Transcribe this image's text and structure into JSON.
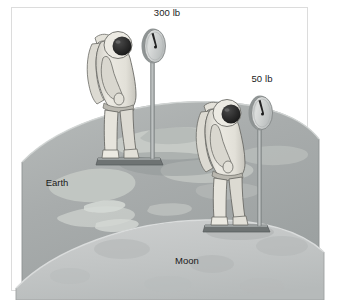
{
  "illustration": {
    "title": "Weight of an astronaut on Earth compared with the Moon",
    "frame": {
      "border_color": "#d8d8d8",
      "background_color": "#ffffff"
    },
    "bodies": [
      {
        "name": "earth",
        "label": "Earth",
        "label_x": 57,
        "label_y": 186,
        "surface_color": "#a9adad",
        "continent_color": "#c3c8c4",
        "edge_color": "#8e9393"
      },
      {
        "name": "moon",
        "label": "Moon",
        "label_x": 187,
        "label_y": 264,
        "surface_color": "#c4c6c6",
        "crater_color": "#b4b7b7",
        "edge_color": "#9ea2a2"
      }
    ],
    "scales": [
      {
        "name": "earth-scale",
        "reading_label": "300 lb",
        "reading_value": 300,
        "reading_unit": "lb",
        "label_x": 167,
        "label_y": 16,
        "dial_cx": 153,
        "dial_cy": 46,
        "dial_rx": 11,
        "dial_ry": 17,
        "post_x": 153,
        "post_top": 63,
        "post_bottom": 161,
        "base_x": 100,
        "base_y": 160,
        "base_w": 60,
        "base_h": 6,
        "needle_angle_deg": -28,
        "dial_face_color": "#d3d5d5",
        "dial_rim_color": "#8f9494",
        "needle_color": "#2a2a2a",
        "post_color": "#a8acac",
        "base_color": "#6e7373"
      },
      {
        "name": "moon-scale",
        "reading_label": "50 lb",
        "reading_value": 50,
        "reading_unit": "lb",
        "label_x": 262,
        "label_y": 82,
        "dial_cx": 260,
        "dial_cy": 113,
        "dial_rx": 11,
        "dial_ry": 17,
        "post_x": 260,
        "post_top": 130,
        "post_bottom": 228,
        "base_x": 207,
        "base_y": 227,
        "base_w": 60,
        "base_h": 6,
        "needle_angle_deg": -28,
        "dial_face_color": "#d3d5d5",
        "dial_rim_color": "#8f9494",
        "needle_color": "#2a2a2a",
        "post_color": "#a8acac",
        "base_color": "#6e7373"
      }
    ],
    "astronauts": [
      {
        "name": "earth-astronaut",
        "standing_on": "earth",
        "x": 88,
        "y": 28,
        "height": 133,
        "suit_color": "#e7e5de",
        "suit_shadow": "#c9c7c0",
        "outline_color": "#6b6b66",
        "visor_color": "#272727",
        "helmet_color": "#e9e7e0"
      },
      {
        "name": "moon-astronaut",
        "standing_on": "moon",
        "x": 197,
        "y": 96,
        "height": 132,
        "suit_color": "#e7e5de",
        "suit_shadow": "#c9c7c0",
        "outline_color": "#6b6b66",
        "visor_color": "#272727",
        "helmet_color": "#e9e7e0"
      }
    ]
  }
}
